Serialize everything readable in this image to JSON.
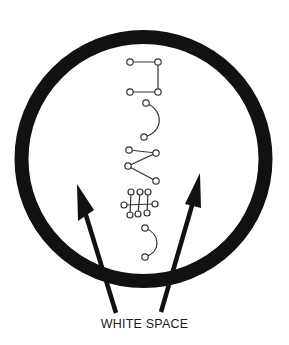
{
  "diagram": {
    "caption": "WHITE SPACE",
    "colors": {
      "stroke": "#111111",
      "symbol_stroke": "#333333",
      "background": "#ffffff"
    },
    "ring": {
      "cx": 143.5,
      "cy": 159,
      "r": 122,
      "thickness": 14
    },
    "symbols": [
      {
        "name": "bracket-symbol",
        "nodes": [
          [
            130,
            62
          ],
          [
            158,
            62
          ],
          [
            158,
            92
          ],
          [
            130,
            92
          ]
        ]
      },
      {
        "name": "arc-symbol-1",
        "nodes": [
          [
            146,
            103
          ],
          [
            144,
            137
          ]
        ]
      },
      {
        "name": "zigzag-symbol",
        "nodes": [
          [
            129,
            150
          ],
          [
            156,
            153
          ],
          [
            128,
            166
          ],
          [
            156,
            181
          ]
        ]
      },
      {
        "name": "ladder-symbol",
        "nodes": [
          [
            131,
            192
          ],
          [
            140,
            192
          ],
          [
            148,
            192
          ],
          [
            124,
            205
          ],
          [
            155,
            204
          ],
          [
            130,
            215
          ],
          [
            138,
            214
          ],
          [
            147,
            213
          ]
        ]
      },
      {
        "name": "arc-symbol-2",
        "nodes": [
          [
            145,
            228
          ],
          [
            145,
            257
          ]
        ]
      }
    ],
    "arrows": [
      {
        "name": "left-arrow",
        "from": [
          116,
          313
        ],
        "to": [
          77,
          184
        ]
      },
      {
        "name": "right-arrow",
        "from": [
          161,
          312
        ],
        "to": [
          200,
          173
        ]
      }
    ]
  }
}
